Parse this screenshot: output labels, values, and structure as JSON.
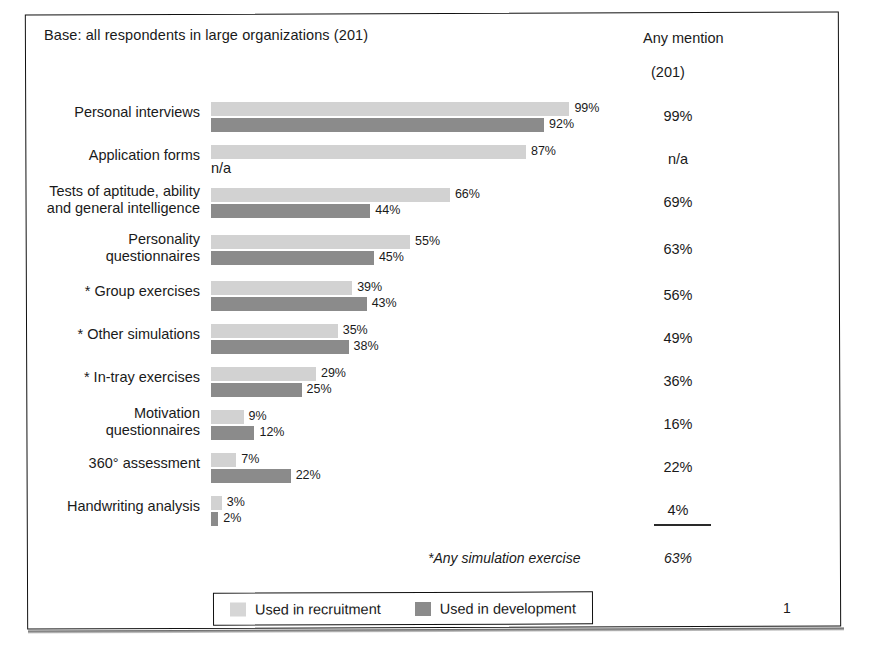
{
  "header": {
    "base_note": "Base: all respondents in large organizations (201)",
    "any_mention_label": "Any mention",
    "any_mention_base": "(201)"
  },
  "legend": {
    "items": [
      {
        "label": "Used in recruitment",
        "color": "#d2d2d2",
        "swatch": "light-swatch"
      },
      {
        "label": "Used in development",
        "color": "#8b8b8b",
        "swatch": "dark-swatch"
      }
    ]
  },
  "footnote": {
    "label": "*Any simulation exercise",
    "value": "63%"
  },
  "page_number": "1",
  "chart_data": {
    "type": "bar",
    "orientation": "horizontal",
    "title": "Base: all respondents in large organizations (201)",
    "xlabel": "",
    "ylabel": "",
    "xlim": [
      0,
      100
    ],
    "grid": false,
    "legend_position": "bottom",
    "value_suffix": "%",
    "categories": [
      "Personal interviews",
      "Application forms",
      "Tests of aptitude, ability\nand general intelligence",
      "Personality\nquestionnaires",
      "* Group exercises",
      "* Other simulations",
      "* In-tray exercises",
      "Motivation\nquestionnaires",
      "360° assessment",
      "Handwriting analysis"
    ],
    "series": [
      {
        "name": "Used in recruitment",
        "color": "#d2d2d2",
        "values": [
          99,
          87,
          66,
          55,
          39,
          35,
          29,
          9,
          7,
          3
        ],
        "labels": [
          "99%",
          "87%",
          "66%",
          "55%",
          "39%",
          "35%",
          "29%",
          "9%",
          "7%",
          "3%"
        ]
      },
      {
        "name": "Used in development",
        "color": "#8b8b8b",
        "values": [
          92,
          null,
          44,
          45,
          43,
          38,
          25,
          12,
          22,
          2
        ],
        "labels": [
          "92%",
          "n/a",
          "44%",
          "45%",
          "43%",
          "38%",
          "25%",
          "12%",
          "22%",
          "2%"
        ]
      }
    ],
    "any_mention": {
      "header": "Any mention",
      "base": "(201)",
      "values": [
        "99%",
        "n/a",
        "69%",
        "63%",
        "56%",
        "49%",
        "36%",
        "16%",
        "22%",
        "4%"
      ]
    },
    "annotations": [
      {
        "text": "*Any simulation exercise",
        "value": "63%",
        "style": "italic"
      }
    ]
  }
}
